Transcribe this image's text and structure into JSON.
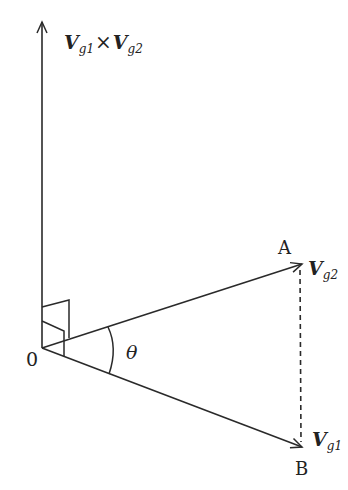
{
  "diagram": {
    "type": "vector-cross-product",
    "stroke_color": "#2a2a2a",
    "labels": {
      "origin": "0",
      "point_a": "A",
      "point_b": "B",
      "angle": "θ",
      "vector_top_v": "V",
      "vector_top_sub1": "g1",
      "vector_top_times": "×",
      "vector_top_v2": "V",
      "vector_top_sub2": "g2",
      "vg2_v": "V",
      "vg2_sub": "g2",
      "vg1_v": "V",
      "vg1_sub": "g1"
    },
    "vectors": [
      {
        "name": "Vg1 × Vg2",
        "from": "O",
        "direction": "up"
      },
      {
        "name": "Vg2",
        "from": "O",
        "to": "A"
      },
      {
        "name": "Vg1",
        "from": "O",
        "to": "B"
      }
    ],
    "dashed_segment": {
      "from": "A",
      "to": "B"
    }
  }
}
